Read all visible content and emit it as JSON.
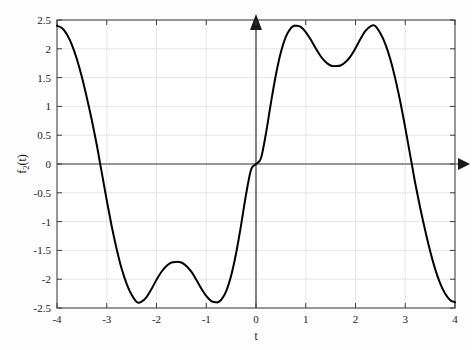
{
  "chart_data": {
    "type": "line",
    "title": "",
    "xlabel": "t",
    "ylabel": "f_2(t)",
    "ylabel_base": "f",
    "ylabel_sub": "2",
    "ylabel_tail": "(t)",
    "xlim": [
      -4,
      4
    ],
    "ylim": [
      -2.5,
      2.5
    ],
    "grid": true,
    "legend": null,
    "xticks": [
      -4,
      -3,
      -2,
      -1,
      0,
      1,
      2,
      3,
      4
    ],
    "xticklabels": [
      "-4",
      "-3",
      "-2",
      "-1",
      "0",
      "1",
      "2",
      "3",
      "4"
    ],
    "yticks": [
      -2.5,
      -2,
      -1.5,
      -1,
      -0.5,
      0,
      0.5,
      1,
      1.5,
      2,
      2.5
    ],
    "yticklabels": [
      "-2.5",
      "-2",
      "-1.5",
      "-1",
      "-0.5",
      "0",
      "0.5",
      "1",
      "1.5",
      "2",
      "2.5"
    ],
    "line_color": "#000000",
    "line_width": 2.0,
    "axis_arrows": [
      "up",
      "right"
    ],
    "zero_crossings": [
      -3.1416,
      0,
      3.1416
    ],
    "extrema": [
      {
        "t": -2.39,
        "value": -2.4,
        "kind": "min"
      },
      {
        "t": -1.55,
        "value": -1.7,
        "kind": "max"
      },
      {
        "t": -0.77,
        "value": -2.4,
        "kind": "min"
      },
      {
        "t": 0.77,
        "value": 2.4,
        "kind": "max"
      },
      {
        "t": 1.55,
        "value": 1.7,
        "kind": "min"
      },
      {
        "t": 2.39,
        "value": 2.4,
        "kind": "max"
      }
    ],
    "endpoints": [
      {
        "t": -4,
        "value": 2.4
      },
      {
        "t": 4,
        "value": -2.4
      }
    ],
    "series": [
      {
        "name": "f_2(t)",
        "x": [
          -4.0,
          -3.9,
          -3.8,
          -3.7,
          -3.6,
          -3.5,
          -3.4,
          -3.3,
          -3.2,
          -3.14,
          -3.1,
          -3.0,
          -2.9,
          -2.8,
          -2.7,
          -2.6,
          -2.5,
          -2.39,
          -2.3,
          -2.2,
          -2.1,
          -2.0,
          -1.9,
          -1.8,
          -1.7,
          -1.6,
          -1.55,
          -1.5,
          -1.4,
          -1.3,
          -1.2,
          -1.1,
          -1.0,
          -0.9,
          -0.8,
          -0.77,
          -0.7,
          -0.6,
          -0.5,
          -0.4,
          -0.3,
          -0.2,
          -0.1,
          0.0,
          0.1,
          0.2,
          0.3,
          0.4,
          0.5,
          0.6,
          0.7,
          0.77,
          0.8,
          0.9,
          1.0,
          1.1,
          1.2,
          1.3,
          1.4,
          1.5,
          1.55,
          1.6,
          1.7,
          1.8,
          1.9,
          2.0,
          2.1,
          2.2,
          2.3,
          2.39,
          2.5,
          2.6,
          2.7,
          2.8,
          2.9,
          3.0,
          3.1,
          3.14,
          3.2,
          3.3,
          3.4,
          3.5,
          3.6,
          3.7,
          3.8,
          3.9,
          4.0
        ],
        "y": [
          2.4,
          2.36,
          2.25,
          2.07,
          1.82,
          1.51,
          1.15,
          0.76,
          0.33,
          0.04,
          -0.15,
          -0.63,
          -1.08,
          -1.48,
          -1.82,
          -2.08,
          -2.27,
          -2.4,
          -2.39,
          -2.31,
          -2.17,
          -2.01,
          -1.87,
          -1.77,
          -1.71,
          -1.7,
          -1.7,
          -1.71,
          -1.77,
          -1.87,
          -2.01,
          -2.16,
          -2.29,
          -2.38,
          -2.4,
          -2.4,
          -2.36,
          -2.21,
          -1.94,
          -1.55,
          -1.06,
          -0.53,
          -0.1,
          0.0,
          0.1,
          0.53,
          1.06,
          1.55,
          1.94,
          2.21,
          2.36,
          2.4,
          2.4,
          2.38,
          2.29,
          2.16,
          2.01,
          1.87,
          1.77,
          1.71,
          1.7,
          1.7,
          1.71,
          1.77,
          1.87,
          2.01,
          2.17,
          2.31,
          2.39,
          2.4,
          2.27,
          2.08,
          1.82,
          1.48,
          1.08,
          0.63,
          0.15,
          -0.04,
          -0.33,
          -0.76,
          -1.15,
          -1.51,
          -1.82,
          -2.07,
          -2.25,
          -2.36,
          -2.4
        ]
      }
    ]
  },
  "axes": {
    "x_axis_name": "horizontal-axis",
    "y_axis_name": "vertical-axis"
  }
}
